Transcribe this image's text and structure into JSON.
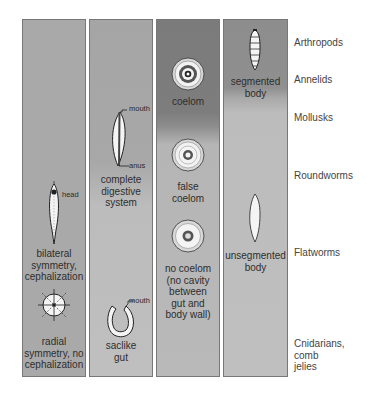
{
  "columns": [
    {
      "id": "symmetry",
      "items": [
        {
          "label": "bilateral symmetry, cephalization",
          "lines": [
            "bilateral",
            "symmetry,",
            "cephalization"
          ],
          "callout": "head",
          "icon": "bilateral-worm-icon"
        },
        {
          "label": "radial symmetry, no cephalization",
          "lines": [
            "radial",
            "symmetry, no",
            "cephalization"
          ],
          "icon": "radial-symmetry-icon"
        }
      ]
    },
    {
      "id": "digestive",
      "items": [
        {
          "label": "complete digestive system",
          "lines": [
            "complete",
            "digestive",
            "system"
          ],
          "callouts": [
            "mouth",
            "anus"
          ],
          "icon": "complete-gut-icon"
        },
        {
          "label": "saclike gut",
          "lines": [
            "saclike",
            "gut"
          ],
          "callout": "mouth",
          "icon": "saclike-gut-icon"
        }
      ]
    },
    {
      "id": "body-cavity",
      "items": [
        {
          "label": "coelom",
          "lines": [
            "coelom"
          ],
          "icon": "coelom-cross-section-icon"
        },
        {
          "label": "false coelom",
          "lines": [
            "false",
            "coelom"
          ],
          "icon": "false-coelom-cross-section-icon"
        },
        {
          "label": "no coelom (no cavity between gut and body wall)",
          "lines": [
            "no coelom",
            "(no cavity",
            "between",
            "gut and",
            "body wall)"
          ],
          "icon": "no-coelom-cross-section-icon"
        }
      ]
    },
    {
      "id": "segmentation",
      "items": [
        {
          "label": "segmented body",
          "lines": [
            "segmented",
            "body"
          ],
          "icon": "segmented-body-icon"
        },
        {
          "label": "unsegmented body",
          "lines": [
            "unsegmented",
            "body"
          ],
          "icon": "unsegmented-body-icon"
        }
      ]
    }
  ],
  "groups": [
    {
      "lines": [
        "Arthropods"
      ]
    },
    {
      "lines": [
        "Annelids"
      ]
    },
    {
      "lines": [
        "Mollusks"
      ]
    },
    {
      "lines": [
        "Roundworms"
      ]
    },
    {
      "lines": [
        "Flatworms"
      ]
    },
    {
      "lines": [
        "Cnidarians,",
        "comb",
        "jelies"
      ]
    }
  ],
  "colors": {
    "column_dark": "#7b7b7b",
    "column_mid": "#a9a9a9",
    "column_light": "#bfbfbf",
    "border": "#777777",
    "text": "#2e2e2e"
  }
}
